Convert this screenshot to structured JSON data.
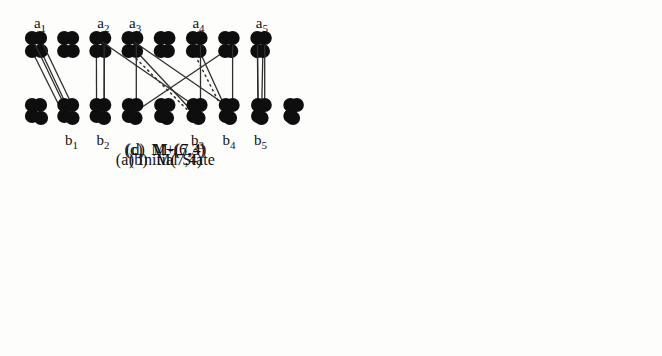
{
  "figure": {
    "colors": {
      "background": "#fdfdfc",
      "dot": "#0e0e0e",
      "edge": "#2e2e2e",
      "label": "#111111"
    },
    "panels": [
      {
        "id": "a",
        "caption": "(a) Initial State",
        "top_dot_count": 8,
        "bottom_dot_count": 9,
        "top_labels": [
          {
            "base": "a",
            "sub": "1",
            "dot": 1
          },
          {
            "base": "a",
            "sub": "2",
            "dot": 3
          },
          {
            "base": "a",
            "sub": "3",
            "dot": 4
          },
          {
            "base": "a",
            "sub": "4",
            "dot": 6
          },
          {
            "base": "a",
            "sub": "5",
            "dot": 8
          }
        ],
        "bottom_labels": [
          {
            "base": "b",
            "sub": "1",
            "dot": 2
          },
          {
            "base": "b",
            "sub": "2",
            "dot": 3
          },
          {
            "base": "b",
            "sub": "3",
            "dot": 6
          },
          {
            "base": "b",
            "sub": "4",
            "dot": 7
          },
          {
            "base": "b",
            "sub": "5",
            "dot": 8
          }
        ],
        "edges": [
          {
            "top": 1,
            "bottom": 2,
            "style": "solid"
          },
          {
            "top": 3,
            "bottom": 3,
            "style": "solid"
          },
          {
            "top": 4,
            "bottom": 6,
            "style": "solid"
          },
          {
            "top": 6,
            "bottom": 7,
            "style": "solid"
          },
          {
            "top": 8,
            "bottom": 8,
            "style": "solid"
          }
        ]
      },
      {
        "id": "b",
        "caption": "(b)  M(7,4)",
        "top_dot_count": 8,
        "bottom_dot_count": 9,
        "top_labels": [],
        "bottom_labels": [],
        "edges": [
          {
            "top": 1,
            "bottom": 2,
            "style": "solid"
          },
          {
            "top": 3,
            "bottom": 3,
            "style": "solid"
          },
          {
            "top": 4,
            "bottom": 6,
            "style": "dotted"
          },
          {
            "top": 6,
            "bottom": 7,
            "style": "dotted"
          },
          {
            "top": 7,
            "bottom": 4,
            "style": "solid"
          },
          {
            "top": 8,
            "bottom": 8,
            "style": "solid"
          }
        ]
      },
      {
        "id": "c",
        "caption": "(c)  M+(7,4)",
        "top_dot_count": 8,
        "bottom_dot_count": 9,
        "top_labels": [],
        "bottom_labels": [],
        "edges": [
          {
            "top": 1,
            "bottom": 2,
            "style": "solid"
          },
          {
            "top": 3,
            "bottom": 3,
            "style": "solid"
          },
          {
            "top": 4,
            "bottom": 4,
            "style": "solid"
          },
          {
            "top": 6,
            "bottom": 6,
            "style": "solid"
          },
          {
            "top": 7,
            "bottom": 7,
            "style": "solid"
          },
          {
            "top": 8,
            "bottom": 8,
            "style": "solid"
          }
        ]
      },
      {
        "id": "d",
        "caption": "(d)  M-(6,3)",
        "top_dot_count": 8,
        "bottom_dot_count": 9,
        "top_labels": [],
        "bottom_labels": [],
        "edges": [
          {
            "top": 1,
            "bottom": 2,
            "style": "solid"
          },
          {
            "top": 3,
            "bottom": 6,
            "style": "solid"
          },
          {
            "top": 4,
            "bottom": 7,
            "style": "solid"
          },
          {
            "top": 8,
            "bottom": 8,
            "style": "solid"
          }
        ]
      }
    ]
  }
}
